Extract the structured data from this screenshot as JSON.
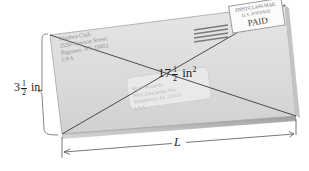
{
  "figure": {
    "width_label": {
      "whole": "3",
      "numerator": "1",
      "denominator": "2",
      "unit": "in."
    },
    "area_label": {
      "whole": "17",
      "numerator": "1",
      "denominator": "2",
      "unit": "in",
      "exponent": "2"
    },
    "length_label": "L",
    "return_address": {
      "line1": "Algebra Club",
      "line2": "3550 Newton Street",
      "line3": "Bigtown, NY 10451",
      "line4": "USA"
    },
    "recipient_address": {
      "line1": "Math Wizards",
      "line2": "2001 Descartes Ave",
      "line3": "Smalltown, FL 33513",
      "line4": "USA"
    },
    "indicia": {
      "line1": "FIRST-CLASS MAIL",
      "line2": "U.S. POSTAGE",
      "line3": "PAID"
    },
    "colors": {
      "envelope_fill": "#dcdcdc",
      "envelope_edge": "#9c9c9c",
      "shadow": "#8a8a8a",
      "diagonal": "#3a3a3a",
      "dimension_line": "#555555",
      "label_text": "#1e1e1e",
      "stripe": "#7a7a7a"
    }
  }
}
